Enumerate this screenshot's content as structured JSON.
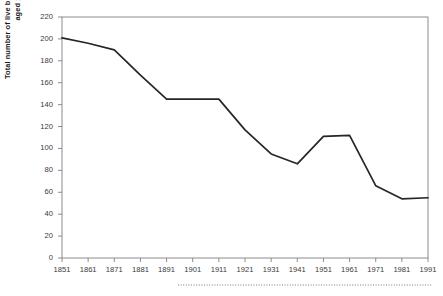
{
  "chart_data": {
    "type": "line",
    "title": "",
    "xlabel": "",
    "ylabel": "Total number of live births per 1000 women aged 15-49",
    "categories": [
      "1851",
      "1861",
      "1871",
      "1881",
      "1891",
      "1901",
      "1911",
      "1921",
      "1931",
      "1941",
      "1951",
      "1961",
      "1971",
      "1981",
      "1991"
    ],
    "values": [
      201,
      196,
      190,
      167,
      145,
      145,
      145,
      117,
      95,
      86,
      111,
      112,
      66,
      54,
      55
    ],
    "series": [
      {
        "name": "Total fertility",
        "values": [
          201,
          196,
          190,
          167,
          145,
          145,
          145,
          117,
          95,
          86,
          111,
          112,
          66,
          54,
          55
        ]
      }
    ],
    "xlim": [
      1851,
      1991
    ],
    "ylim": [
      0,
      220
    ],
    "ytick_values": [
      0,
      20,
      40,
      60,
      80,
      100,
      120,
      140,
      160,
      180,
      200,
      220
    ],
    "ytick_labels": [
      "0",
      "20",
      "40",
      "60",
      "80",
      "100",
      "120",
      "140",
      "160",
      "180",
      "200",
      "220"
    ],
    "xtick_labels": [
      "1851",
      "1861",
      "1871",
      "1881",
      "1891",
      "1901",
      "1911",
      "1921",
      "1931",
      "1941",
      "1951",
      "1961",
      "1971",
      "1981",
      "1991"
    ],
    "grid": false,
    "legend": "none",
    "line_color": "#262626",
    "axis_color": "#8c8c8c",
    "text_color": "#3a3a3a"
  },
  "decoration": {
    "footer_rule": "dotted-separator"
  }
}
